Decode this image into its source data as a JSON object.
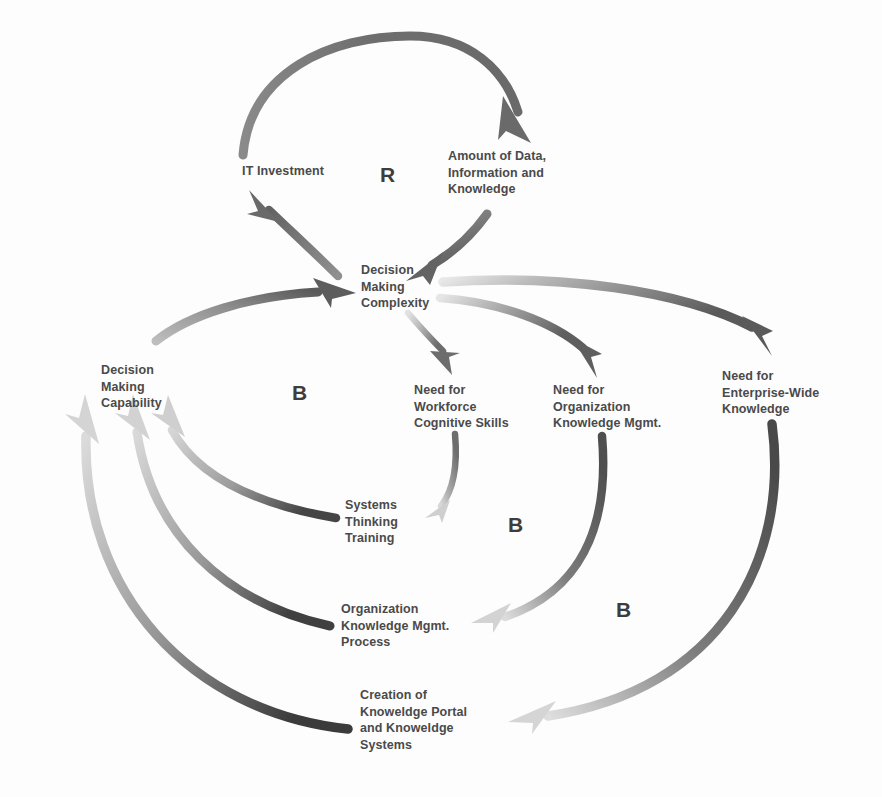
{
  "diagram": {
    "type": "causal-loop-diagram",
    "title": "",
    "ink_color": "#6b6b6b",
    "text_color": "#4a4a4a",
    "background": "#fdfdfd",
    "nodes": [
      {
        "id": "it-investment",
        "label": "IT Investment",
        "x": 218,
        "y": 163,
        "width": 130,
        "align": "center"
      },
      {
        "id": "amount-of-data",
        "label": "Amount of Data,\nInformation and\nKnowledge",
        "x": 448,
        "y": 148,
        "width": 130,
        "align": "left"
      },
      {
        "id": "decision-making-complexity",
        "label": "Decision\nMaking\nComplexity",
        "x": 361,
        "y": 262,
        "width": 110,
        "align": "left"
      },
      {
        "id": "decision-making-capability",
        "label": "Decision\nMaking\nCapability",
        "x": 101,
        "y": 362,
        "width": 105,
        "align": "left"
      },
      {
        "id": "need-workforce-cognitive-skills",
        "label": "Need for\nWorkforce\nCognitive Skills",
        "x": 414,
        "y": 382,
        "width": 120,
        "align": "left"
      },
      {
        "id": "need-organization-knowledge-mgmt",
        "label": "Need for\nOrganization\nKnowledge Mgmt.",
        "x": 553,
        "y": 382,
        "width": 128,
        "align": "left"
      },
      {
        "id": "need-enterprise-wide-knowledge",
        "label": "Need for\nEnterprise-Wide\nKnowledge",
        "x": 722,
        "y": 368,
        "width": 135,
        "align": "left"
      },
      {
        "id": "systems-thinking-training",
        "label": "Systems\nThinking\nTraining",
        "x": 345,
        "y": 497,
        "width": 105,
        "align": "left"
      },
      {
        "id": "organization-knowledge-mgmt-process",
        "label": "Organization\nKnowledge Mgmt.\nProcess",
        "x": 341,
        "y": 601,
        "width": 135,
        "align": "left"
      },
      {
        "id": "creation-of-knowledge-portal",
        "label": "Creation of\nKnoweldge Portal\nand Knoweldge\nSystems",
        "x": 360,
        "y": 687,
        "width": 140,
        "align": "left"
      }
    ],
    "loop_labels": [
      {
        "id": "loop-r-top",
        "label": "R",
        "x": 380,
        "y": 163
      },
      {
        "id": "loop-b-left",
        "label": "B",
        "x": 292,
        "y": 381
      },
      {
        "id": "loop-b-middle",
        "label": "B",
        "x": 508,
        "y": 513
      },
      {
        "id": "loop-b-right",
        "label": "B",
        "x": 616,
        "y": 598
      }
    ],
    "links": [
      {
        "id": "link-it-to-data",
        "from": "it-investment",
        "to": "amount-of-data"
      },
      {
        "id": "link-data-to-complexity",
        "from": "amount-of-data",
        "to": "decision-making-complexity"
      },
      {
        "id": "link-complexity-to-it",
        "from": "decision-making-complexity",
        "to": "it-investment"
      },
      {
        "id": "link-capability-to-complexity",
        "from": "decision-making-capability",
        "to": "decision-making-complexity"
      },
      {
        "id": "link-complexity-to-workforce",
        "from": "decision-making-complexity",
        "to": "need-workforce-cognitive-skills"
      },
      {
        "id": "link-complexity-to-orgkm",
        "from": "decision-making-complexity",
        "to": "need-organization-knowledge-mgmt"
      },
      {
        "id": "link-complexity-to-enterprise",
        "from": "decision-making-complexity",
        "to": "need-enterprise-wide-knowledge"
      },
      {
        "id": "link-workforce-to-systems",
        "from": "need-workforce-cognitive-skills",
        "to": "systems-thinking-training"
      },
      {
        "id": "link-orgkm-to-process",
        "from": "need-organization-knowledge-mgmt",
        "to": "organization-knowledge-mgmt-process"
      },
      {
        "id": "link-enterprise-to-portal",
        "from": "need-enterprise-wide-knowledge",
        "to": "creation-of-knowledge-portal"
      },
      {
        "id": "link-systems-to-capability",
        "from": "systems-thinking-training",
        "to": "decision-making-capability"
      },
      {
        "id": "link-process-to-capability",
        "from": "organization-knowledge-mgmt-process",
        "to": "decision-making-capability"
      },
      {
        "id": "link-portal-to-capability",
        "from": "creation-of-knowledge-portal",
        "to": "decision-making-capability"
      }
    ]
  }
}
